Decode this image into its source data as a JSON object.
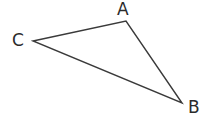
{
  "figure": {
    "kind": "geometry-diagram",
    "shape_name": "triangle",
    "width": 209,
    "height": 129,
    "background_color": "#ffffff",
    "stroke_color": "#3a3a3a",
    "stroke_width": 1.4,
    "label_color": "#2b2b2b",
    "label_font_size": 17
  },
  "vertices": [
    {
      "id": "A",
      "label": "A",
      "x": 126,
      "y": 21,
      "label_x": 117,
      "label_y": 1
    },
    {
      "id": "C",
      "label": "C",
      "x": 33,
      "y": 41,
      "label_x": 12,
      "label_y": 32
    },
    {
      "id": "B",
      "label": "B",
      "x": 182,
      "y": 103,
      "label_x": 188,
      "label_y": 99
    }
  ],
  "edges": [
    {
      "id": "CA",
      "from": "C",
      "to": "A"
    },
    {
      "id": "AB",
      "from": "A",
      "to": "B"
    },
    {
      "id": "BC",
      "from": "B",
      "to": "C"
    }
  ],
  "polygon_points": "33,41 126,21 182,103"
}
